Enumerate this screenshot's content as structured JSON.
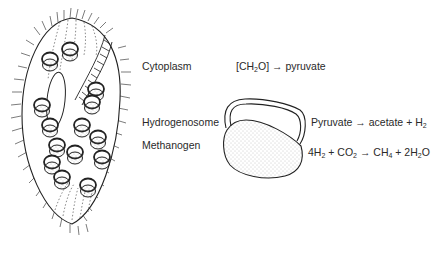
{
  "figure": {
    "organism": "ciliate-with-endosymbionts",
    "labels": {
      "cytoplasm": "Cytoplasm",
      "hydrogenosome": "Hydrogenosome",
      "methanogen": "Methanogen"
    },
    "reactions": {
      "cytoplasm": {
        "pre": "[CH",
        "sub1": "2",
        "post": "O] → pyruvate"
      },
      "hydrogenosome": {
        "pre": "Pyruvate → acetate + H",
        "sub1": "2"
      },
      "methanogen": {
        "a": "4H",
        "a_sub": "2",
        "b": " + CO",
        "b_sub": "2",
        "c": " → CH",
        "c_sub": "4",
        "d": " + 2H",
        "d_sub": "2",
        "e": "O"
      }
    },
    "colors": {
      "line": "#2a2a2a",
      "stipple": "#9a9a9a",
      "background": "#ffffff"
    }
  }
}
